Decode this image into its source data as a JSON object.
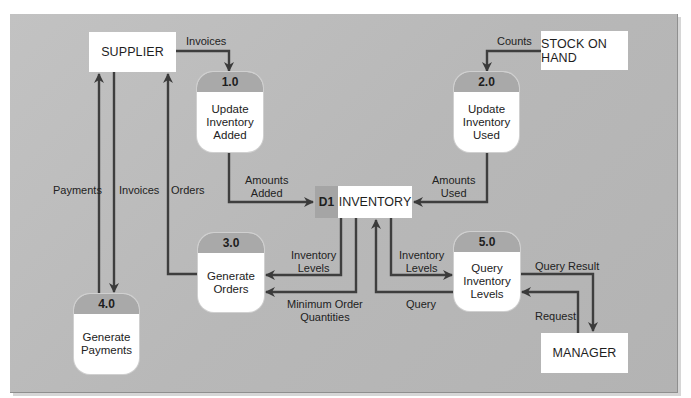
{
  "diagram": {
    "type": "data-flow-diagram",
    "external_entities": {
      "supplier": "SUPPLIER",
      "stock_on_hand": "STOCK ON HAND",
      "manager": "MANAGER"
    },
    "processes": [
      {
        "id": "1.0",
        "name": "Update\nInventory\nAdded"
      },
      {
        "id": "2.0",
        "name": "Update\nInventory\nUsed"
      },
      {
        "id": "3.0",
        "name": "Generate\nOrders"
      },
      {
        "id": "4.0",
        "name": "Generate\nPayments"
      },
      {
        "id": "5.0",
        "name": "Query\nInventory\nLevels"
      }
    ],
    "data_store": {
      "id": "D1",
      "name": "INVENTORY"
    },
    "flows": {
      "supplier_to_p1": "Invoices",
      "stock_to_p2": "Counts",
      "p1_to_store": "Amounts\nAdded",
      "p2_to_store": "Amounts\nUsed",
      "p4_to_supplier": "Payments",
      "supplier_to_p4": "Invoices",
      "p3_to_supplier": "Orders",
      "store_to_p3_levels": "Inventory\nLevels",
      "store_to_p3_minimum": "Minimum Order\nQuantities",
      "store_to_p5": "Inventory\nLevels",
      "p5_to_store": "Query",
      "p5_to_manager": "Query Result",
      "manager_to_p5": "Request"
    }
  }
}
